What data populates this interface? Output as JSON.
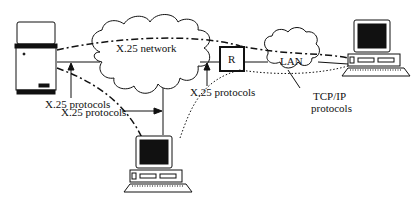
{
  "diagram": {
    "type": "network-topology",
    "nodes": [
      {
        "id": "host",
        "kind": "host-tower",
        "icon": "server-tower-icon"
      },
      {
        "id": "x25",
        "kind": "cloud",
        "label": "X.25 network"
      },
      {
        "id": "router",
        "kind": "router",
        "label": "R"
      },
      {
        "id": "lan",
        "kind": "cloud",
        "label": "LAN"
      },
      {
        "id": "ws_right",
        "kind": "workstation",
        "icon": "computer-icon"
      },
      {
        "id": "ws_bottom",
        "kind": "workstation",
        "icon": "computer-icon"
      }
    ],
    "labels": {
      "x25_network": "X.25 network",
      "router": "R",
      "lan": "LAN",
      "host_protocols": "X.25 protocols",
      "bottom_protocols": "X.25 protocols",
      "router_protocols": "X.25 protocols",
      "tcpip_line1": "TCP/IP",
      "tcpip_line2": "protocols"
    },
    "line_styles": {
      "x25_link": "solid",
      "host_to_right": "dash-dot",
      "host_to_bottom": "dash-dot",
      "bottom_to_right": "dotted"
    },
    "colors": {
      "stroke": "#111111",
      "background": "#ffffff",
      "screen": "#111111"
    }
  }
}
